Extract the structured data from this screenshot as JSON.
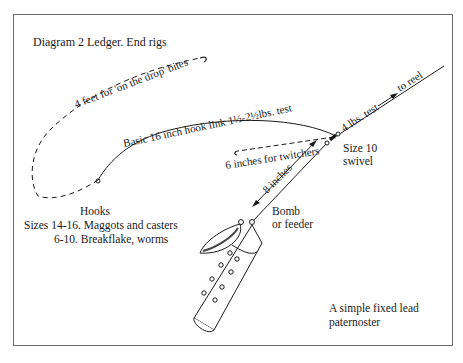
{
  "diagram": {
    "title": "Diagram 2 Ledger. End rigs",
    "labels": {
      "dropper_length": "4 feet for 'on the drop' bites",
      "hook_link": "Basic 16 inch hook link 1½-2½lbs. test",
      "main_line": "4 lbs. test",
      "to_reel": "to reel",
      "swivel_line1": "Size 10",
      "swivel_line2": "swivel",
      "twitchers": "6 inches for twitchers",
      "boom_length": "8 inches",
      "bomb_line1": "Bomb",
      "bomb_line2": "or feeder",
      "caption_line1": "A simple fixed lead",
      "caption_line2": "paternoster"
    },
    "hooks": {
      "heading": "Hooks",
      "line1": "Sizes 14-16. Maggots and casters",
      "line2": "6-10. Breakflake, worms"
    },
    "colors": {
      "line": "#1a1a1a",
      "frame": "#6b6b6b",
      "background": "#ffffff"
    }
  }
}
